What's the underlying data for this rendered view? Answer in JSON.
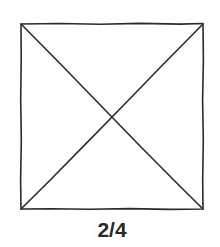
{
  "figure": {
    "shape": "square-with-diagonals",
    "stroke_color": "#2b2b2b",
    "square": {
      "x1": 21,
      "y1": 24,
      "x2": 203,
      "y2": 209
    }
  },
  "caption": {
    "text": "2/4"
  }
}
